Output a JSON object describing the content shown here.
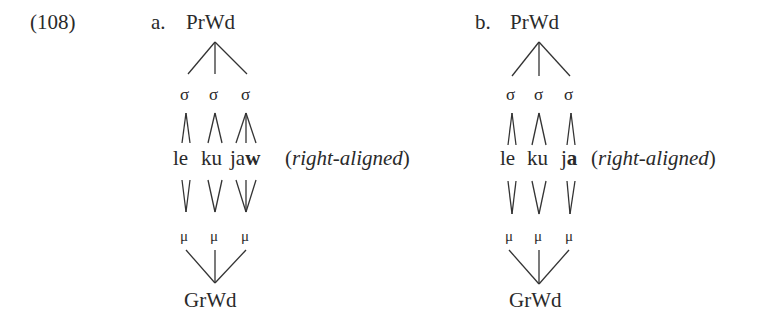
{
  "example": {
    "number": "(108)",
    "panels": [
      {
        "label": "a.",
        "top_node": "PrWd",
        "syllables": [
          "σ",
          "σ",
          "σ"
        ],
        "segments": [
          "le",
          "ku",
          "ja"
        ],
        "segment_bold_tail": "w",
        "annotation_open": "(",
        "annotation": "right-aligned",
        "annotation_close": ")",
        "morae": [
          "μ",
          "μ",
          "μ"
        ],
        "bottom_node": "GrWd"
      },
      {
        "label": "b.",
        "top_node": "PrWd",
        "syllables": [
          "σ",
          "σ",
          "σ"
        ],
        "segments": [
          "le",
          "ku",
          "j"
        ],
        "segment_bold_tail": "a",
        "annotation_open": "(",
        "annotation": "right-aligned",
        "annotation_close": ")",
        "morae": [
          "μ",
          "μ",
          "μ"
        ],
        "bottom_node": "GrWd"
      }
    ]
  }
}
